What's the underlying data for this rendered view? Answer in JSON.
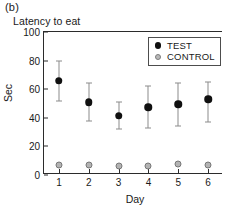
{
  "panel_label": "(b)",
  "axis": {
    "ylabel": "Sec",
    "xlabel": "Day",
    "yticks": [
      "100",
      "80",
      "60",
      "40",
      "20",
      "0"
    ],
    "xticks": [
      "1",
      "2",
      "3",
      "4",
      "5",
      "6"
    ]
  },
  "legend": {
    "entries": [
      {
        "label": "TEST",
        "marker": "filled-circle",
        "color": "#101010"
      },
      {
        "label": "CONTROL",
        "marker": "open-circle",
        "color": "#b8b8b8"
      }
    ]
  },
  "chart_data": {
    "type": "scatter",
    "title": "Latency to eat",
    "xlabel": "Day",
    "ylabel": "Sec",
    "xlim": [
      0.5,
      6.5
    ],
    "ylim": [
      0,
      100
    ],
    "ytick_interval": 20,
    "grid": false,
    "legend_position": "top-right",
    "categories": [
      1,
      2,
      3,
      4,
      5,
      6
    ],
    "series": [
      {
        "name": "TEST",
        "color": "#101010",
        "marker": "filled-circle",
        "values": [
          66,
          51,
          41.5,
          47.5,
          49.5,
          53
        ],
        "error_low": [
          52,
          38,
          32,
          33,
          34.5,
          37
        ],
        "error_high": [
          80,
          64,
          51,
          62,
          64,
          65
        ]
      },
      {
        "name": "CONTROL",
        "color": "#b8b8b8",
        "marker": "open-circle",
        "values": [
          7,
          7,
          6.5,
          6.5,
          8,
          7
        ],
        "error_low": [
          null,
          null,
          null,
          null,
          null,
          null
        ],
        "error_high": [
          null,
          null,
          null,
          null,
          null,
          null
        ]
      }
    ]
  }
}
